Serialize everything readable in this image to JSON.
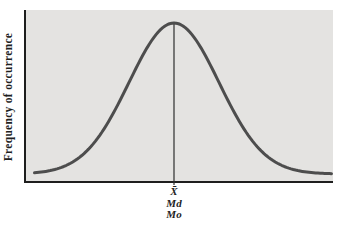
{
  "figure": {
    "kind": "normal-distribution-diagram"
  },
  "colors": {
    "page_background": "#ffffff",
    "plot_background": "#e4e3e1",
    "curve": "#4d4d4d",
    "axis": "#1e1e1e",
    "center_line": "#2e2e2e",
    "text": "#1f1f1f"
  },
  "chart_data": {
    "type": "line",
    "curve": "normal-distribution",
    "title": "",
    "xlabel": "",
    "ylabel": "Frequency of occurrence",
    "x_units": "deviation from center (sigma)",
    "x_range": [
      -3.1,
      3.5
    ],
    "y_function": "y = exp(-x^2 / 2)",
    "y_range": [
      0,
      1
    ],
    "grid": false,
    "legend": false,
    "axis_ticks": "none",
    "annotations": {
      "center_line_x": 0,
      "labels": [
        "X̄",
        "Md",
        "Mo"
      ],
      "labels_meaning": [
        "mean",
        "median",
        "mode"
      ],
      "note": "mean, median and mode coincide at the center peak of the symmetric curve"
    }
  }
}
